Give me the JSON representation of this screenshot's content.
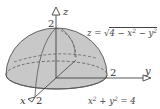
{
  "figure": {
    "fill_color": "#c8c8c8",
    "line_color": "#555555",
    "background": "#ffffff"
  },
  "axes": {
    "z": {
      "label": "z",
      "tick_label": "2"
    },
    "y": {
      "label": "y",
      "tick_label": "2"
    },
    "x": {
      "label": "x",
      "tick_label": "2"
    }
  },
  "annotations": {
    "surface_eq": {
      "lhs": "z = ",
      "radical": "4 − x",
      "exp1": "2",
      "mid": " − y",
      "exp2": "2"
    },
    "boundary_eq": {
      "x": "x",
      "exp1": "2",
      "plus": " + y",
      "exp2": "2",
      "rhs": " = 4"
    }
  }
}
